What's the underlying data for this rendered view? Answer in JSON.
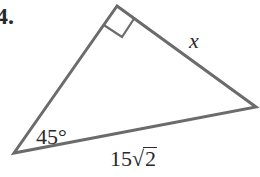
{
  "problem": {
    "number_label": "4."
  },
  "triangle": {
    "vertices": {
      "right_angle": [
        117,
        5
      ],
      "bottom_left": [
        14,
        153
      ],
      "right": [
        256,
        107
      ]
    },
    "stroke_color": "#6b6b6b",
    "right_angle_marker": true
  },
  "labels": {
    "leg": "x",
    "angle": "45°",
    "hypotenuse_coefficient": "15",
    "hypotenuse_radical_symbol": "√",
    "hypotenuse_radicand": "2"
  }
}
